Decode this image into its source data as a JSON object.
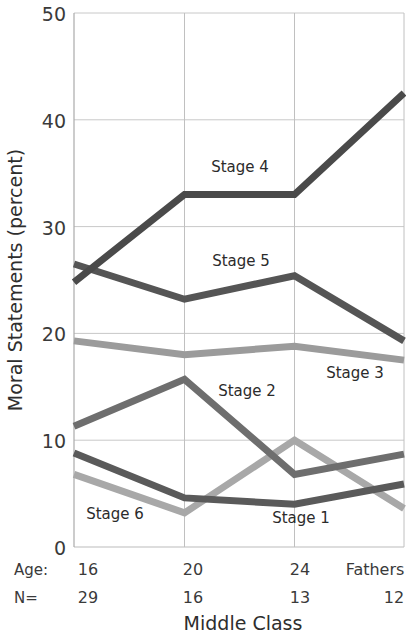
{
  "chart_data": {
    "type": "line",
    "title": "",
    "xlabel": "Middle Class",
    "ylabel": "Moral Statements (percent)",
    "ylim": [
      0,
      50
    ],
    "yticks": [
      0,
      10,
      20,
      30,
      40,
      50
    ],
    "grid": true,
    "legend_position": "inline-labels",
    "categories": [
      "16",
      "20",
      "24",
      "Fathers"
    ],
    "x_axis_rows": [
      {
        "row_label": "Age:",
        "values": [
          "16",
          "20",
          "24",
          "Fathers"
        ]
      },
      {
        "row_label": "N=",
        "values": [
          "29",
          "16",
          "13",
          "12"
        ]
      }
    ],
    "series": [
      {
        "name": "Stage 4",
        "values": [
          24.8,
          33.0,
          33.0,
          42.5
        ],
        "color": "#4a4a4a",
        "label_x": "20",
        "label_value": 36.2
      },
      {
        "name": "Stage 5",
        "values": [
          26.5,
          23.2,
          25.4,
          19.3
        ],
        "color": "#555555",
        "label_x": "20",
        "label_value": 26.8
      },
      {
        "name": "Stage 3",
        "values": [
          19.3,
          18.0,
          18.8,
          17.5
        ],
        "color": "#9b9b9b",
        "label_x": "24",
        "label_value": 16.4
      },
      {
        "name": "Stage 2",
        "values": [
          11.3,
          15.7,
          6.8,
          8.7
        ],
        "color": "#6e6e6e",
        "label_x": "20",
        "label_value": 12.6
      },
      {
        "name": "Stage 1",
        "values": [
          8.8,
          4.6,
          4.0,
          5.9
        ],
        "color": "#5a5a5a",
        "label_x": "24",
        "label_value": 2.3
      },
      {
        "name": "Stage 6",
        "values": [
          6.8,
          3.2,
          10.0,
          3.6
        ],
        "color": "#a8a8a8",
        "label_x": "16",
        "label_value": 2.3
      }
    ]
  },
  "axis": {
    "y_title": "Moral Statements (percent)",
    "x_title": "Middle Class",
    "y_tick_labels": [
      "50",
      "40",
      "30",
      "20",
      "10",
      "0"
    ],
    "age_row_label": "Age:",
    "n_row_label": "N="
  },
  "colors": {
    "background": "#ffffff",
    "grid": "#c8c8c8",
    "axis": "#909090",
    "text": "#333333"
  }
}
